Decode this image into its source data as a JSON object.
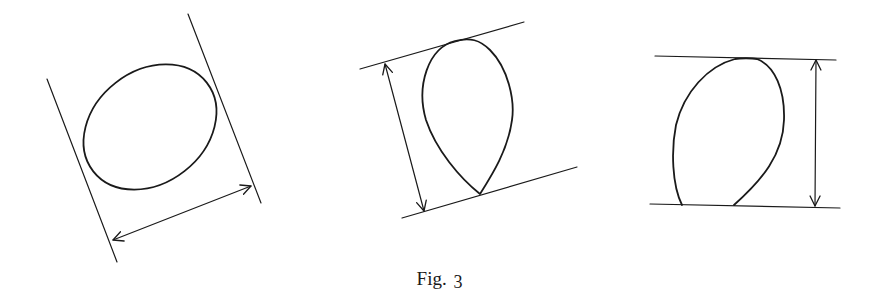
{
  "caption": {
    "label": "Fig.",
    "number": "3"
  },
  "figures": [
    {
      "id": "tilted-ellipse",
      "description": "Ellipse between two parallel tangent lines with double-headed width arrow"
    },
    {
      "id": "teardrop",
      "description": "Teardrop shape between two parallel tilted lines with double-headed width arrow"
    },
    {
      "id": "egg",
      "description": "Egg shape between two horizontal lines with vertical double-headed width arrow"
    }
  ],
  "colors": {
    "ink": "#1a1a1a",
    "background": "#ffffff"
  }
}
